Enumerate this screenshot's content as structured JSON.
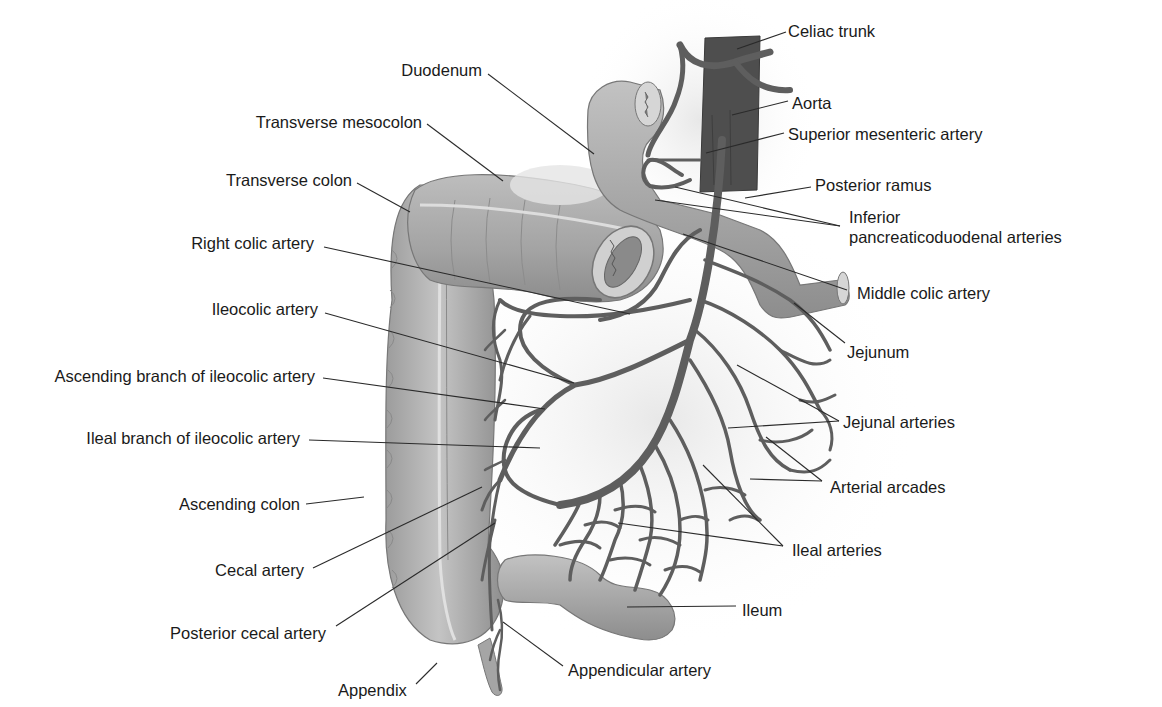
{
  "figure": {
    "type": "anatomical-illustration",
    "colors": {
      "background": "#ffffff",
      "label_text": "#1a1a1a",
      "leader_line": "#2a2a2a",
      "artery": "#5e5e5e",
      "aorta": "#4a4a4a",
      "colon": "#a9a9a9",
      "bowel": "#b5b5b5"
    }
  },
  "labels": [
    {
      "id": "celiac-trunk",
      "text": "Celiac trunk",
      "x": 788,
      "y": 21,
      "align": "left",
      "line": [
        [
          786,
          32
        ],
        [
          737,
          49
        ]
      ]
    },
    {
      "id": "duodenum",
      "text": "Duodenum",
      "x": 300,
      "y": 60,
      "align": "right",
      "w": 182,
      "line": [
        [
          488,
          74
        ],
        [
          594,
          154
        ]
      ]
    },
    {
      "id": "aorta",
      "text": "Aorta",
      "x": 792,
      "y": 93,
      "align": "left",
      "line": [
        [
          788,
          101
        ],
        [
          732,
          115
        ]
      ]
    },
    {
      "id": "superior-mesenteric-artery",
      "text": "Superior mesenteric artery",
      "x": 788,
      "y": 124,
      "align": "left",
      "line": [
        [
          784,
          133
        ],
        [
          706,
          153
        ]
      ]
    },
    {
      "id": "transverse-mesocolon",
      "text": "Transverse mesocolon",
      "x": 238,
      "y": 112,
      "align": "right",
      "w": 184,
      "line": [
        [
          427,
          124
        ],
        [
          503,
          181
        ]
      ]
    },
    {
      "id": "transverse-colon",
      "text": "Transverse colon",
      "x": 200,
      "y": 170,
      "align": "right",
      "w": 152,
      "line": [
        [
          357,
          183
        ],
        [
          410,
          212
        ]
      ]
    },
    {
      "id": "posterior-ramus",
      "text": "Posterior ramus",
      "x": 815,
      "y": 175,
      "align": "left",
      "line": [
        [
          811,
          187
        ],
        [
          745,
          198
        ]
      ]
    },
    {
      "id": "inferior-pancreaticoduodenal-arteries",
      "text": "Inferior\npancreaticoduodenal arteries",
      "x": 849,
      "y": 207,
      "align": "left",
      "lines": [
        [
          [
            840,
            226
          ],
          [
            675,
            187
          ]
        ],
        [
          [
            840,
            226
          ],
          [
            655,
            200
          ]
        ]
      ]
    },
    {
      "id": "right-colic-artery",
      "text": "Right colic artery",
      "x": 176,
      "y": 233,
      "align": "right",
      "w": 138,
      "line": [
        [
          324,
          247
        ],
        [
          630,
          314
        ]
      ]
    },
    {
      "id": "middle-colic-artery",
      "text": "Middle colic artery",
      "x": 857,
      "y": 283,
      "align": "left",
      "line": [
        [
          847,
          290
        ],
        [
          683,
          234
        ]
      ]
    },
    {
      "id": "ileocolic-artery",
      "text": "Ileocolic artery",
      "x": 198,
      "y": 299,
      "align": "right",
      "w": 120,
      "line": [
        [
          325,
          313
        ],
        [
          574,
          383
        ]
      ]
    },
    {
      "id": "jejunum",
      "text": "Jejunum",
      "x": 847,
      "y": 342,
      "align": "left",
      "line": [
        [
          845,
          343
        ],
        [
          794,
          303
        ]
      ]
    },
    {
      "id": "ascending-branch-of-ileocolic-artery",
      "text": "Ascending branch of ileocolic artery",
      "x": 23,
      "y": 366,
      "align": "right",
      "w": 292,
      "line": [
        [
          323,
          378
        ],
        [
          545,
          409
        ]
      ]
    },
    {
      "id": "jejunal-arteries",
      "text": "Jejunal arteries",
      "x": 843,
      "y": 412,
      "align": "left",
      "lines": [
        [
          [
            839,
            421
          ],
          [
            737,
            365
          ]
        ],
        [
          [
            839,
            421
          ],
          [
            728,
            428
          ]
        ]
      ]
    },
    {
      "id": "ileal-branch-of-ileocolic-artery",
      "text": "Ileal branch of ileocolic artery",
      "x": 60,
      "y": 428,
      "align": "right",
      "w": 240,
      "line": [
        [
          309,
          440
        ],
        [
          540,
          448
        ]
      ]
    },
    {
      "id": "arterial-arcades",
      "text": "Arterial arcades",
      "x": 830,
      "y": 477,
      "align": "left",
      "lines": [
        [
          [
            822,
            481
          ],
          [
            766,
            437
          ]
        ],
        [
          [
            822,
            481
          ],
          [
            750,
            479
          ]
        ]
      ]
    },
    {
      "id": "ascending-colon",
      "text": "Ascending colon",
      "x": 164,
      "y": 494,
      "align": "right",
      "w": 136,
      "line": [
        [
          306,
          504
        ],
        [
          364,
          497
        ]
      ]
    },
    {
      "id": "ileal-arteries",
      "text": "Ileal arteries",
      "x": 792,
      "y": 540,
      "align": "left",
      "lines": [
        [
          [
            783,
            546
          ],
          [
            703,
            465
          ]
        ],
        [
          [
            783,
            546
          ],
          [
            618,
            523
          ]
        ]
      ]
    },
    {
      "id": "cecal-artery",
      "text": "Cecal artery",
      "x": 204,
      "y": 560,
      "align": "right",
      "w": 100,
      "line": [
        [
          313,
          568
        ],
        [
          482,
          487
        ]
      ]
    },
    {
      "id": "ileum",
      "text": "Ileum",
      "x": 742,
      "y": 600,
      "align": "left",
      "line": [
        [
          736,
          606
        ],
        [
          627,
          607
        ]
      ]
    },
    {
      "id": "posterior-cecal-artery",
      "text": "Posterior cecal artery",
      "x": 152,
      "y": 623,
      "align": "right",
      "w": 174,
      "line": [
        [
          336,
          626
        ],
        [
          495,
          523
        ]
      ]
    },
    {
      "id": "appendicular-artery",
      "text": "Appendicular artery",
      "x": 568,
      "y": 660,
      "align": "left",
      "line": [
        [
          563,
          666
        ],
        [
          503,
          622
        ]
      ]
    },
    {
      "id": "appendix",
      "text": "Appendix",
      "x": 338,
      "y": 680,
      "align": "left",
      "line": [
        [
          416,
          684
        ],
        [
          437,
          663
        ]
      ]
    }
  ]
}
